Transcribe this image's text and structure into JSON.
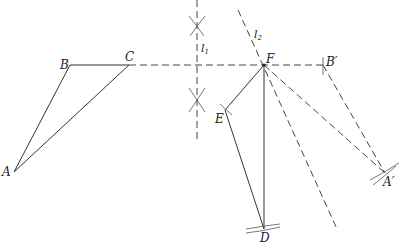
{
  "diagram": {
    "title": "",
    "points": [
      {
        "id": "A",
        "label": "A",
        "x": 14,
        "y": 172
      },
      {
        "id": "B",
        "label": "B",
        "x": 70,
        "y": 65
      },
      {
        "id": "C",
        "label": "C",
        "x": 129,
        "y": 65
      },
      {
        "id": "F",
        "label": "F",
        "x": 264,
        "y": 65
      },
      {
        "id": "Bp",
        "label": "B′",
        "x": 323,
        "y": 65
      },
      {
        "id": "E",
        "label": "E",
        "x": 225,
        "y": 110
      },
      {
        "id": "D",
        "label": "D",
        "x": 264,
        "y": 229
      },
      {
        "id": "Ap",
        "label": "A′",
        "x": 385,
        "y": 173
      }
    ],
    "lines": [
      {
        "id": "l1",
        "label": "l",
        "subscript": "1",
        "style": "dashed",
        "description": "perpendicular bisector (vertical)"
      },
      {
        "id": "l2",
        "label": "l",
        "subscript": "2",
        "style": "dashed",
        "description": "line through F"
      }
    ],
    "segments_solid": [
      "AB",
      "BC",
      "AC",
      "FE",
      "ED",
      "FD"
    ],
    "segments_dashed": [
      "CB′",
      "FB′",
      "FA′",
      "B′A′"
    ],
    "labels": {
      "A": "A",
      "B": "B",
      "C": "C",
      "D": "D",
      "E": "E",
      "F": "F",
      "Bp": "B′",
      "Ap": "A′",
      "l1": "l",
      "l1_sub": "1",
      "l2": "l",
      "l2_sub": "2"
    }
  }
}
